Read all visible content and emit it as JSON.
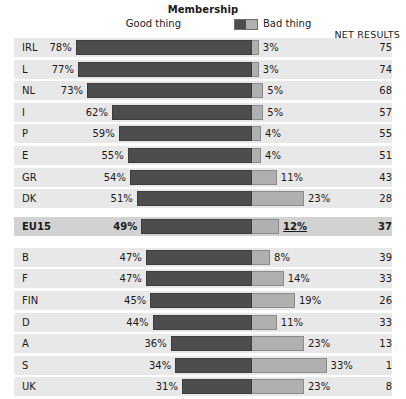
{
  "legend": {
    "title": "Membership",
    "good_label": "Good thing",
    "bad_label": "Bad thing",
    "good_color": "#4d4d4d",
    "bad_color": "#b0b0b0",
    "swatch_name": "two-tone-legend-swatch"
  },
  "columns": {
    "net_header": "NET RESULTS"
  },
  "chart_data": {
    "type": "bar",
    "title": "Membership",
    "xlabel": "",
    "ylabel": "",
    "orientation": "horizontal",
    "stacked": true,
    "diverging": true,
    "grid": false,
    "legend_position": "top-center",
    "categories": [
      "IRL",
      "L",
      "NL",
      "I",
      "P",
      "E",
      "GR",
      "DK",
      "EU15",
      "B",
      "F",
      "FIN",
      "D",
      "A",
      "S",
      "UK"
    ],
    "series": [
      {
        "name": "Good thing",
        "values": [
          78,
          77,
          73,
          62,
          59,
          55,
          54,
          51,
          49,
          47,
          47,
          45,
          44,
          36,
          34,
          31
        ]
      },
      {
        "name": "Bad thing",
        "values": [
          3,
          3,
          5,
          5,
          4,
          4,
          11,
          23,
          12,
          8,
          14,
          19,
          11,
          23,
          33,
          23
        ]
      }
    ],
    "net_results": [
      75,
      74,
      68,
      57,
      55,
      51,
      43,
      28,
      37,
      39,
      33,
      26,
      33,
      13,
      1,
      8
    ],
    "value_suffix": "%"
  },
  "rows": [
    {
      "label": "IRL",
      "good": "78%",
      "bad": "3%",
      "net": "75",
      "good_val": 78,
      "bad_val": 3,
      "highlight": false
    },
    {
      "label": "L",
      "good": "77%",
      "bad": "3%",
      "net": "74",
      "good_val": 77,
      "bad_val": 3,
      "highlight": false
    },
    {
      "label": "NL",
      "good": "73%",
      "bad": "5%",
      "net": "68",
      "good_val": 73,
      "bad_val": 5,
      "highlight": false
    },
    {
      "label": "I",
      "good": "62%",
      "bad": "5%",
      "net": "57",
      "good_val": 62,
      "bad_val": 5,
      "highlight": false
    },
    {
      "label": "P",
      "good": "59%",
      "bad": "4%",
      "net": "55",
      "good_val": 59,
      "bad_val": 4,
      "highlight": false
    },
    {
      "label": "E",
      "good": "55%",
      "bad": "4%",
      "net": "51",
      "good_val": 55,
      "bad_val": 4,
      "highlight": false
    },
    {
      "label": "GR",
      "good": "54%",
      "bad": "11%",
      "net": "43",
      "good_val": 54,
      "bad_val": 11,
      "highlight": false
    },
    {
      "label": "DK",
      "good": "51%",
      "bad": "23%",
      "net": "28",
      "good_val": 51,
      "bad_val": 23,
      "highlight": false
    },
    {
      "label": "EU15",
      "good": "49%",
      "bad": "12%",
      "net": "37",
      "good_val": 49,
      "bad_val": 12,
      "highlight": true
    },
    {
      "label": "B",
      "good": "47%",
      "bad": "8%",
      "net": "39",
      "good_val": 47,
      "bad_val": 8,
      "highlight": false
    },
    {
      "label": "F",
      "good": "47%",
      "bad": "14%",
      "net": "33",
      "good_val": 47,
      "bad_val": 14,
      "highlight": false
    },
    {
      "label": "FIN",
      "good": "45%",
      "bad": "19%",
      "net": "26",
      "good_val": 45,
      "bad_val": 19,
      "highlight": false
    },
    {
      "label": "D",
      "good": "44%",
      "bad": "11%",
      "net": "33",
      "good_val": 44,
      "bad_val": 11,
      "highlight": false
    },
    {
      "label": "A",
      "good": "36%",
      "bad": "23%",
      "net": "13",
      "good_val": 36,
      "bad_val": 23,
      "highlight": false
    },
    {
      "label": "S",
      "good": "34%",
      "bad": "33%",
      "net": "1",
      "good_val": 34,
      "bad_val": 33,
      "highlight": false
    },
    {
      "label": "UK",
      "good": "31%",
      "bad": "23%",
      "net": "8",
      "good_val": 31,
      "bad_val": 23,
      "highlight": false
    }
  ]
}
